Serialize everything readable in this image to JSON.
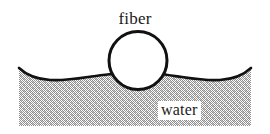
{
  "figure": {
    "type": "schematic-cross-section",
    "canvas": {
      "width": 270,
      "height": 134,
      "background": "#ffffff"
    },
    "labels": {
      "fiber": "fiber",
      "water": "water"
    },
    "elements": {
      "fiber_circle": {
        "name": "fiber",
        "shape": "circle",
        "center_x": 138,
        "center_y": 60.5,
        "radius": 29,
        "fill": "#ffffff",
        "stroke": "#111111",
        "stroke_width": 3
      },
      "water_body": {
        "name": "water",
        "fill_pattern": "stipple-halftone-gray",
        "fill_color": "#b0b0b0",
        "surface_line_color": "#111111",
        "surface_line_width": 2.6,
        "left_edge_x": 19,
        "right_edge_x": 251,
        "bottom_y": 126,
        "flat_level_y": 80,
        "contact_y": 74,
        "edge_top_y": 68
      }
    },
    "annotations": {
      "meniscus": "concave meniscus rising toward the fiber and toward the outer edges",
      "contact_angle_note": "water surface meets the fiber above its equator"
    }
  }
}
